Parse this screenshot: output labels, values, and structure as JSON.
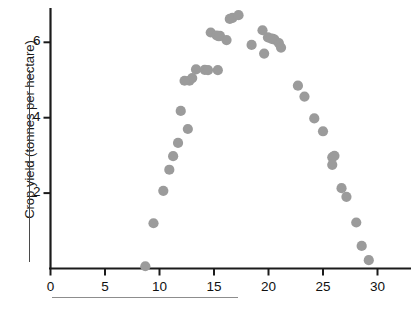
{
  "chart_data": {
    "type": "scatter",
    "title": "",
    "xlabel": "",
    "ylabel": "Crop yield (tonnes per hectare)",
    "xlim": [
      0,
      33.2
    ],
    "ylim": [
      0,
      6.95
    ],
    "grid": false,
    "legend": null,
    "xticks": [
      0,
      5,
      10,
      15,
      20,
      25,
      30
    ],
    "xticklabels": [
      "0",
      "5",
      "10",
      "15",
      "20",
      "25",
      "30"
    ],
    "yticks": [
      2,
      4,
      6
    ],
    "yticklabels": [
      "2",
      "4",
      "6"
    ],
    "marker": {
      "shape": "circle",
      "color": "#9b9b9b",
      "radius_px": 5.1,
      "opacity": 1
    },
    "axis_color": "#1b1b1b",
    "n_points": 44,
    "points": [
      {
        "x": 8.7,
        "y": 0.06
      },
      {
        "x": 9.45,
        "y": 1.2
      },
      {
        "x": 10.35,
        "y": 2.06
      },
      {
        "x": 10.9,
        "y": 2.62
      },
      {
        "x": 11.25,
        "y": 2.98
      },
      {
        "x": 11.7,
        "y": 3.33
      },
      {
        "x": 11.95,
        "y": 4.18
      },
      {
        "x": 12.6,
        "y": 3.7
      },
      {
        "x": 12.75,
        "y": 4.98
      },
      {
        "x": 13.0,
        "y": 5.05
      },
      {
        "x": 13.35,
        "y": 5.28
      },
      {
        "x": 14.15,
        "y": 5.27
      },
      {
        "x": 14.45,
        "y": 5.26
      },
      {
        "x": 15.35,
        "y": 5.26
      },
      {
        "x": 14.7,
        "y": 6.26
      },
      {
        "x": 15.25,
        "y": 6.18
      },
      {
        "x": 15.55,
        "y": 6.17
      },
      {
        "x": 16.15,
        "y": 6.06
      },
      {
        "x": 16.45,
        "y": 6.62
      },
      {
        "x": 16.7,
        "y": 6.65
      },
      {
        "x": 17.25,
        "y": 6.72
      },
      {
        "x": 18.45,
        "y": 5.93
      },
      {
        "x": 19.45,
        "y": 6.32
      },
      {
        "x": 19.6,
        "y": 5.7
      },
      {
        "x": 19.95,
        "y": 6.13
      },
      {
        "x": 20.4,
        "y": 6.09
      },
      {
        "x": 20.55,
        "y": 6.07
      },
      {
        "x": 20.95,
        "y": 5.98
      },
      {
        "x": 21.15,
        "y": 5.86
      },
      {
        "x": 22.7,
        "y": 4.85
      },
      {
        "x": 23.3,
        "y": 4.56
      },
      {
        "x": 24.2,
        "y": 3.98
      },
      {
        "x": 25.0,
        "y": 3.64
      },
      {
        "x": 25.85,
        "y": 2.95
      },
      {
        "x": 26.05,
        "y": 2.99
      },
      {
        "x": 25.85,
        "y": 2.75
      },
      {
        "x": 26.7,
        "y": 2.13
      },
      {
        "x": 27.15,
        "y": 1.9
      },
      {
        "x": 28.05,
        "y": 1.22
      },
      {
        "x": 28.55,
        "y": 0.6
      },
      {
        "x": 29.2,
        "y": 0.22
      },
      {
        "x": 12.3,
        "y": 4.98
      },
      {
        "x": 15.45,
        "y": 6.16
      },
      {
        "x": 20.25,
        "y": 6.1
      }
    ]
  },
  "axes": {
    "y_axis_label": "Crop yield (tonnes per hectare)",
    "x_axis_label_hidden": "",
    "y_tick_labels": [
      "6",
      "4",
      "2"
    ],
    "x_tick_labels": [
      "0",
      "5",
      "10",
      "15",
      "20",
      "25",
      "30"
    ]
  }
}
